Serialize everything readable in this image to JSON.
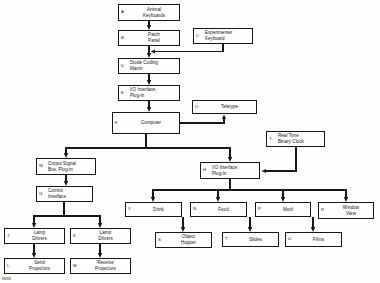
{
  "diagram": {
    "type": "block-flow-diagram",
    "line_color": "#171717",
    "background_color": "#fdfdfb",
    "nodes": [
      {
        "id": "A",
        "tag": "A",
        "label": "Animal\nKeyboards",
        "x": 118,
        "y": 4,
        "w": 62,
        "h": 17,
        "align": "center"
      },
      {
        "id": "B",
        "tag": "B",
        "label": "Patch\nPanel",
        "x": 118,
        "y": 30,
        "w": 62,
        "h": 16,
        "align": "center"
      },
      {
        "id": "C",
        "tag": "C",
        "label": "Experimenter\nKeyboard",
        "x": 193,
        "y": 28,
        "w": 60,
        "h": 16,
        "align": "lead"
      },
      {
        "id": "D",
        "tag": "D",
        "label": "Diode Coding\nMatrix",
        "x": 118,
        "y": 58,
        "w": 62,
        "h": 16,
        "align": "lead"
      },
      {
        "id": "E",
        "tag": "E",
        "label": "I/O Interface,\nPlug-in",
        "x": 118,
        "y": 85,
        "w": 62,
        "h": 16,
        "align": "lead"
      },
      {
        "id": "F",
        "tag": "F",
        "label": "Computer",
        "x": 112,
        "y": 112,
        "w": 68,
        "h": 22,
        "align": "center"
      },
      {
        "id": "O",
        "tag": "O",
        "label": "Teletype",
        "x": 192,
        "y": 100,
        "w": 65,
        "h": 14,
        "align": "center"
      },
      {
        "id": "Y",
        "tag": "Y",
        "label": "Real Time\nBinary Clock",
        "x": 266,
        "y": 131,
        "w": 59,
        "h": 16,
        "align": "lead"
      },
      {
        "id": "W",
        "tag": "W",
        "label": "Output Signal\nBus, Plug-in",
        "x": 36,
        "y": 158,
        "w": 60,
        "h": 17,
        "align": "lead"
      },
      {
        "id": "H",
        "tag": "H",
        "label": "I/O Interface,\nPlug-in",
        "x": 200,
        "y": 162,
        "w": 60,
        "h": 17,
        "align": "lead"
      },
      {
        "id": "G",
        "tag": "G",
        "label": "Control\nInterface",
        "x": 36,
        "y": 186,
        "w": 57,
        "h": 16,
        "align": "lead"
      },
      {
        "id": "V",
        "tag": "V",
        "label": "Drink",
        "x": 125,
        "y": 202,
        "w": 57,
        "h": 15,
        "align": "center"
      },
      {
        "id": "N",
        "tag": "N",
        "label": "Food",
        "x": 190,
        "y": 202,
        "w": 57,
        "h": 15,
        "align": "center"
      },
      {
        "id": "P",
        "tag": "P",
        "label": "Motrl",
        "x": 255,
        "y": 202,
        "w": 56,
        "h": 15,
        "align": "center"
      },
      {
        "id": "R",
        "tag": "R",
        "label": "Window\nView",
        "x": 318,
        "y": 202,
        "w": 56,
        "h": 17,
        "align": "center"
      },
      {
        "id": "J",
        "tag": "J",
        "label": "Lamp\nDrivers",
        "x": 4,
        "y": 228,
        "w": 61,
        "h": 16,
        "align": "center"
      },
      {
        "id": "K",
        "tag": "K",
        "label": "Lamp\nDrivers",
        "x": 70,
        "y": 228,
        "w": 61,
        "h": 16,
        "align": "center"
      },
      {
        "id": "S",
        "tag": "S",
        "label": "Object\nHopper",
        "x": 155,
        "y": 232,
        "w": 57,
        "h": 16,
        "align": "center"
      },
      {
        "id": "T",
        "tag": "T",
        "label": "Slides",
        "x": 222,
        "y": 232,
        "w": 57,
        "h": 15,
        "align": "center"
      },
      {
        "id": "U",
        "tag": "U",
        "label": "Films",
        "x": 285,
        "y": 232,
        "w": 57,
        "h": 15,
        "align": "center"
      },
      {
        "id": "L",
        "tag": "L",
        "label": "Send\nProjectors",
        "x": 4,
        "y": 258,
        "w": 61,
        "h": 16,
        "align": "center"
      },
      {
        "id": "M",
        "tag": "M",
        "label": "'Receive'\nProjectors",
        "x": 70,
        "y": 258,
        "w": 61,
        "h": 16,
        "align": "center"
      }
    ],
    "connections": [
      {
        "from": "A",
        "to": "B",
        "kind": "vertical-arrow"
      },
      {
        "from": "C",
        "to": "D",
        "kind": "elbow-merge-arrow"
      },
      {
        "from": "B",
        "to": "D",
        "kind": "vertical-arrow"
      },
      {
        "from": "D",
        "to": "E",
        "kind": "vertical-arrow"
      },
      {
        "from": "E",
        "to": "F",
        "kind": "vertical-arrow"
      },
      {
        "from": "F",
        "to": "O",
        "kind": "elbow-arrow"
      },
      {
        "from": "F",
        "to": "W",
        "kind": "split-arrow"
      },
      {
        "from": "F",
        "to": "H",
        "kind": "split-arrow"
      },
      {
        "from": "Y",
        "to": "H",
        "kind": "elbow-arrow"
      },
      {
        "from": "W",
        "to": "G",
        "kind": "vertical-arrow"
      },
      {
        "from": "G",
        "to": "J",
        "kind": "split-arrow"
      },
      {
        "from": "G",
        "to": "K",
        "kind": "split-arrow"
      },
      {
        "from": "J",
        "to": "L",
        "kind": "vertical-arrow"
      },
      {
        "from": "K",
        "to": "M",
        "kind": "vertical-arrow"
      },
      {
        "from": "H",
        "to": "V",
        "kind": "split-arrow"
      },
      {
        "from": "H",
        "to": "N",
        "kind": "split-arrow"
      },
      {
        "from": "H",
        "to": "P",
        "kind": "split-arrow"
      },
      {
        "from": "H",
        "to": "R",
        "kind": "split-arrow"
      },
      {
        "from": "V",
        "to": "S",
        "kind": "vertical-arrow"
      },
      {
        "from": "N",
        "to": "T",
        "kind": "vertical-arrow"
      },
      {
        "from": "P",
        "to": "U",
        "kind": "vertical-arrow"
      }
    ]
  }
}
